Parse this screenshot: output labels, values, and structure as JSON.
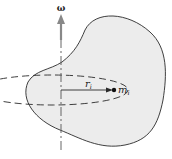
{
  "diagram": {
    "axis_label": "ω",
    "radius_label": "r",
    "radius_subscript": "i",
    "mass_label": "m",
    "mass_subscript": "i",
    "colors": {
      "body_fill": "#ececec",
      "outline": "#2a2a2a",
      "axis": "#555555",
      "arrow": "#777777"
    }
  }
}
